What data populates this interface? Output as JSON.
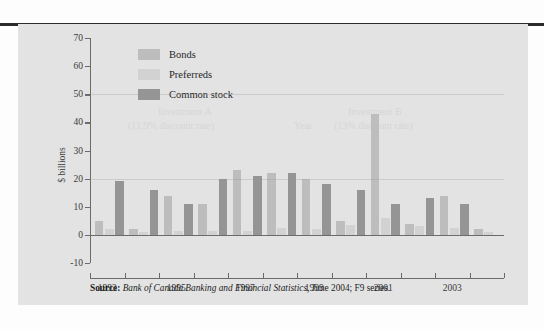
{
  "figure": {
    "source_prefix": "Source:",
    "source_italic": "Bank of Canada Banking and Financial Statistics,",
    "source_rest": " June 2004; F9 series."
  },
  "legend": {
    "position": "top-left-inside",
    "items": [
      {
        "label": "Bonds",
        "color": "#bdbdbd"
      },
      {
        "label": "Preferreds",
        "color": "#d2d2d2"
      },
      {
        "label": "Common stock",
        "color": "#959595"
      }
    ]
  },
  "bleed_text": {
    "line1": "all the period. Further, anyone in Investment B expected a loss precisely if Investment A",
    "line2": "returns on Investment B. Because rate Variables fill in the period. Look closer. As each and",
    "line3": "everything else the same, Investment A is used the only available alternative."
  },
  "watermarks": {
    "w1": "Investment A",
    "w2": "(11.9% discount rate)",
    "w3": "Year",
    "w4": "Investment B",
    "w5": "(13% discount rate)"
  },
  "chart_data": {
    "type": "bar",
    "title": "",
    "subtitle": "",
    "xlabel": "",
    "ylabel": "$ billions",
    "ylim": [
      -10,
      70
    ],
    "yticks": [
      -10,
      0,
      10,
      20,
      30,
      40,
      50,
      60,
      70
    ],
    "ytick_labels": [
      "-10",
      "0",
      "10",
      "20",
      "30",
      "40",
      "50",
      "60",
      "70"
    ],
    "grid": false,
    "categories": [
      "1993",
      "1994",
      "1995",
      "1996",
      "1997",
      "1998",
      "1999",
      "2000",
      "2001",
      "2002",
      "2003",
      "2004"
    ],
    "xtick_labels": [
      "1993",
      "1995",
      "1997",
      "1999",
      "2001",
      "2003"
    ],
    "series": [
      {
        "name": "Bonds",
        "color": "#bdbdbd",
        "values": [
          5,
          2,
          14,
          11,
          23,
          22,
          20,
          5,
          43,
          4,
          14,
          2
        ]
      },
      {
        "name": "Preferreds",
        "color": "#d2d2d2",
        "values": [
          2,
          1,
          1.5,
          1.5,
          1.5,
          2.5,
          2,
          3.5,
          6,
          3,
          2.5,
          1
        ]
      },
      {
        "name": "Common stock",
        "color": "#959595",
        "values": [
          19,
          16,
          11,
          20,
          21,
          22,
          18,
          16,
          11,
          13,
          11,
          0
        ]
      }
    ]
  }
}
